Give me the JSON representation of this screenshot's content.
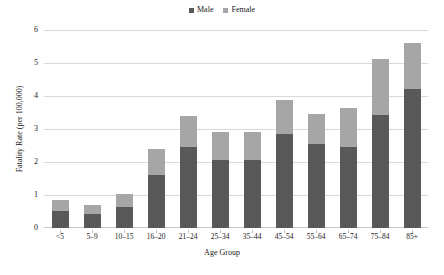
{
  "chart_data": {
    "type": "bar",
    "subtype": "stacked-bar",
    "title": "",
    "xlabel": "Age Group",
    "ylabel": "Fatality Rate (per 100,000)",
    "ylim": [
      0,
      6
    ],
    "ytick_step": 1,
    "yticks": [
      "6",
      "5",
      "4",
      "3",
      "2",
      "1",
      "0"
    ],
    "grid": true,
    "legend_position": "top-center",
    "categories": [
      "<5",
      "5–9",
      "10–15",
      "16–20",
      "21–24",
      "25–34",
      "35–44",
      "45–54",
      "55–64",
      "65–74",
      "75–84",
      "85+"
    ],
    "series": [
      {
        "name": "Male",
        "color": "#595959",
        "values": [
          0.53,
          0.42,
          0.63,
          1.62,
          2.45,
          2.07,
          2.05,
          2.86,
          2.55,
          2.47,
          3.42,
          4.21
        ]
      },
      {
        "name": "Female",
        "color": "#a6a6a6",
        "values": [
          0.32,
          0.28,
          0.41,
          0.77,
          0.93,
          0.83,
          0.86,
          1.02,
          0.92,
          1.18,
          1.69,
          1.41
        ]
      }
    ],
    "totals": [
      0.85,
      0.7,
      1.04,
      2.39,
      3.38,
      2.9,
      2.91,
      3.88,
      3.47,
      3.65,
      5.11,
      5.62
    ]
  },
  "legend": {
    "items": [
      {
        "label": "Male",
        "color": "#595959"
      },
      {
        "label": "Female",
        "color": "#a6a6a6"
      }
    ]
  },
  "axes": {
    "y": {
      "title": "Fatality Rate (per 100,000)",
      "ticks": [
        "6",
        "5",
        "4",
        "3",
        "2",
        "1",
        "0"
      ]
    },
    "x": {
      "title": "Age Group",
      "ticks": [
        "<5",
        "5–9",
        "10–15",
        "16–20",
        "21–24",
        "25–34",
        "35–44",
        "45–54",
        "55–64",
        "65–74",
        "75–84",
        "85+"
      ]
    }
  },
  "style": {
    "background": "#ffffff",
    "gridline_color": "#d9d9d9",
    "text_color": "#1a1a1a"
  }
}
